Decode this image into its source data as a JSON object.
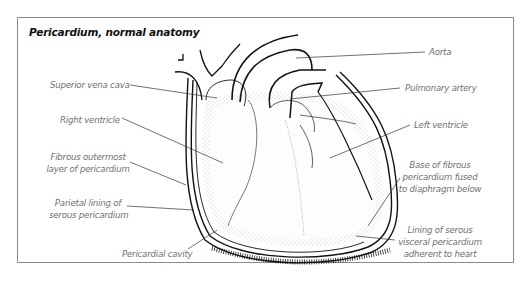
{
  "figure": {
    "title": "Pericardium, normal anatomy"
  },
  "labels": {
    "superior_vena_cava": "Superior vena cava",
    "right_ventricle": "Right ventricle",
    "fibrous_outermost_1": "Fibrous outermost",
    "fibrous_outermost_2": "layer of pericardium",
    "parietal_lining_1": "Parietal lining of",
    "parietal_lining_2": "serous pericardium",
    "pericardial_cavity": "Pericardial cavity",
    "aorta": "Aorta",
    "pulmonary_artery": "Pulmonary artery",
    "left_ventricle": "Left ventricle",
    "base_fibrous_1": "Base of fibrous",
    "base_fibrous_2": "pericardium fused",
    "base_fibrous_3": "to diaphragm below",
    "lining_serous_1": "Lining of serous",
    "lining_serous_2": "visceral pericardium",
    "lining_serous_3": "adherent to heart"
  },
  "colors": {
    "outline": "#111111",
    "label_text": "#707070",
    "leader_line": "#333333",
    "stipple": "#8a8a8a",
    "frame": "#8a8a8a"
  }
}
